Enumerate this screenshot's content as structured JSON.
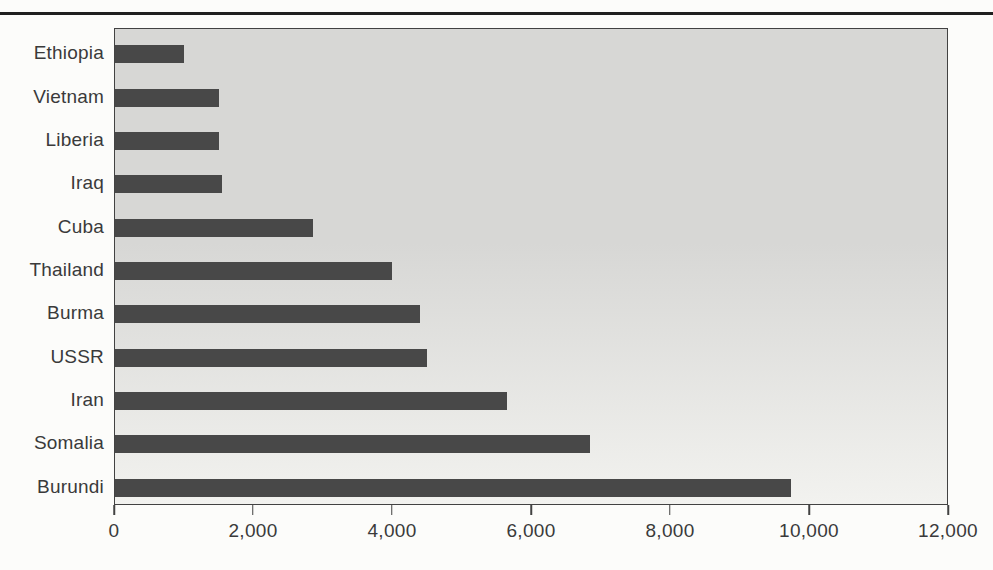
{
  "page": {
    "background": "#fcfcfa",
    "top_rule_color": "#1f1f1f"
  },
  "chart_data": {
    "type": "bar",
    "orientation": "horizontal",
    "title": "",
    "xlabel": "",
    "ylabel": "",
    "categories": [
      "Ethiopia",
      "Vietnam",
      "Liberia",
      "Iraq",
      "Cuba",
      "Thailand",
      "Burma",
      "USSR",
      "Iran",
      "Somalia",
      "Burundi"
    ],
    "values": [
      1000,
      1500,
      1500,
      1550,
      2850,
      4000,
      4400,
      4500,
      5650,
      6850,
      9750
    ],
    "xlim": [
      0,
      12000
    ],
    "xticks": [
      0,
      2000,
      4000,
      6000,
      8000,
      10000,
      12000
    ],
    "xtick_labels": [
      "0",
      "2,000",
      "4,000",
      "6,000",
      "8,000",
      "10,000",
      "12,000"
    ],
    "grid": false,
    "legend_position": "none",
    "style": {
      "bar_color": "#484848",
      "plot_bg_top": "#d7d7d5",
      "plot_bg_bottom": "#f2f2ef",
      "frame_color": "#424242",
      "text_color": "#3a3a3a"
    }
  }
}
